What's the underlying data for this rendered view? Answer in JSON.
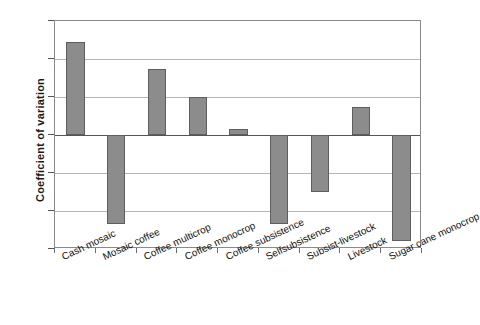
{
  "chart_data": {
    "type": "bar",
    "title": "",
    "xlabel": "",
    "ylabel": "Coefficient of variation",
    "ylim": [
      -0.6,
      0.6
    ],
    "yticks": [
      0.6,
      0.4,
      0.2,
      0,
      -0.2,
      -0.4,
      -0.6
    ],
    "ytick_labels": [
      "0.6",
      "0.4",
      "0.2",
      "0",
      "-0.2",
      "-0.4",
      "-0.6"
    ],
    "grid": true,
    "legend": null,
    "categories": [
      "Cash mosaic",
      "Mosaic coffee",
      "Coffee multicrop",
      "Coffee monocrop",
      "Coffee subsistence",
      "Selfsubsistence",
      "Subsist-livestock",
      "Livestock",
      "Sugar cane monocrop"
    ],
    "values": [
      0.49,
      -0.47,
      0.35,
      0.2,
      0.03,
      -0.47,
      -0.3,
      0.15,
      -0.56
    ],
    "bar_color": "#8c8c8c",
    "bar_edge_color": "#5e5e5e",
    "grid_color": "#b5b5b5",
    "axis_color": "#8a8a8a"
  }
}
